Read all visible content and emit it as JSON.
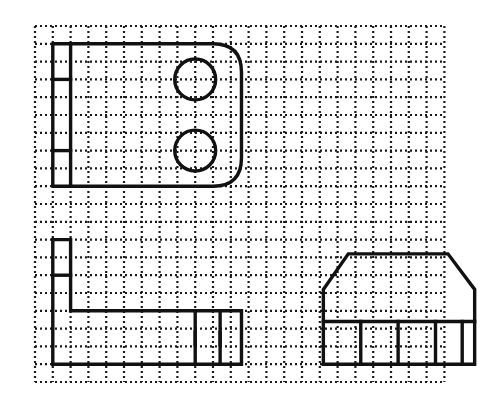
{
  "canvas": {
    "width": 503,
    "height": 408,
    "background_color": "#ffffff",
    "ink_color": "#111111",
    "grid_color": "#1a1a1a"
  },
  "grid": {
    "name": "dotted-isometric-worksheet-grid",
    "origin_x": 35,
    "origin_y": 26,
    "pitch": 17.8,
    "columns": 23,
    "rows": 20,
    "dot_size": 2.2,
    "dash_pattern": "2 3",
    "style": "dotted-square-grid"
  },
  "figures": [
    {
      "id": "figure-top-left",
      "label": "Rounded-end bracket with two holes",
      "stroke_width": 3.4,
      "outline": {
        "type": "rounded-rect-path",
        "x0": 1,
        "y0": 1,
        "x1": 11.6,
        "y1": 9,
        "corner_radius_cells": 1.6,
        "rounded_corners": [
          "top-right",
          "bottom-right"
        ]
      },
      "internal_lines": [
        {
          "name": "left-column-divider",
          "x1": 2,
          "y1": 1,
          "x2": 2,
          "y2": 9
        },
        {
          "name": "upper-box-bottom",
          "x1": 1,
          "y1": 3,
          "x2": 2,
          "y2": 3
        },
        {
          "name": "lower-box-top",
          "x1": 1,
          "y1": 7,
          "x2": 2,
          "y2": 7
        }
      ],
      "circles": [
        {
          "name": "upper-hole",
          "cx": 9,
          "cy": 3,
          "r": 1.15
        },
        {
          "name": "lower-hole",
          "cx": 9,
          "cy": 7,
          "r": 1.15
        }
      ]
    },
    {
      "id": "figure-bottom-left",
      "label": "L-shaped angle bracket with two end cells",
      "stroke_width": 3.4,
      "outline": {
        "type": "polygon",
        "points": [
          [
            1,
            12
          ],
          [
            2,
            12
          ],
          [
            2,
            16
          ],
          [
            11.6,
            16
          ],
          [
            11.6,
            19
          ],
          [
            1,
            19
          ]
        ]
      },
      "internal_lines": [
        {
          "name": "upper-box-bottom",
          "x1": 1,
          "y1": 14,
          "x2": 2,
          "y2": 14
        },
        {
          "name": "cell-divider-1",
          "x1": 9,
          "y1": 16,
          "x2": 9,
          "y2": 19
        },
        {
          "name": "cell-divider-2",
          "x1": 10.4,
          "y1": 16,
          "x2": 10.4,
          "y2": 19
        },
        {
          "name": "tick-left",
          "x1": 9,
          "y1": 17.2,
          "x2": 9,
          "y2": 17.9
        },
        {
          "name": "tick-right",
          "x1": 10.4,
          "y1": 17.2,
          "x2": 10.4,
          "y2": 17.9
        }
      ],
      "circles": []
    },
    {
      "id": "figure-bottom-right",
      "label": "Chamfered block with four base cells",
      "stroke_width": 3.4,
      "outline": {
        "type": "polygon",
        "points": [
          [
            16.2,
            14.8
          ],
          [
            17.6,
            12.8
          ],
          [
            23.2,
            12.8
          ],
          [
            24.7,
            14.8
          ],
          [
            24.7,
            19
          ],
          [
            16.2,
            19
          ]
        ]
      },
      "internal_lines": [
        {
          "name": "base-band-top",
          "x1": 16.2,
          "y1": 16.6,
          "x2": 24.7,
          "y2": 16.6
        },
        {
          "name": "base-cell-divider-1",
          "x1": 18.3,
          "y1": 16.6,
          "x2": 18.3,
          "y2": 19
        },
        {
          "name": "base-cell-divider-2",
          "x1": 20.4,
          "y1": 16.6,
          "x2": 20.4,
          "y2": 19
        },
        {
          "name": "base-cell-divider-3",
          "x1": 22.5,
          "y1": 16.6,
          "x2": 22.5,
          "y2": 19
        },
        {
          "name": "base-cell-divider-4",
          "x1": 24.0,
          "y1": 16.6,
          "x2": 24.0,
          "y2": 19
        }
      ],
      "circles": []
    }
  ]
}
